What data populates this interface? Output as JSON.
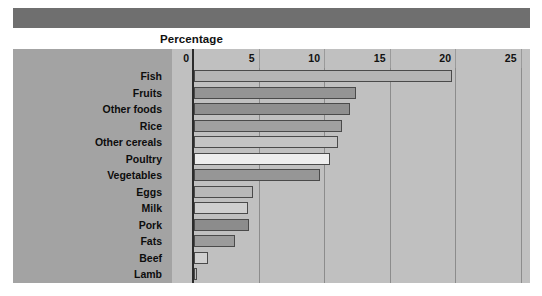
{
  "figure": {
    "axis_title": "Percentage",
    "top_band_color": "#6f6f6f",
    "frame_color": "#c0c0c0",
    "category_panel_color": "#a3a3a3"
  },
  "chart_data": {
    "type": "bar",
    "orientation": "horizontal",
    "title": "",
    "xlabel": "Percentage",
    "ylabel": "",
    "xlim": [
      0,
      27
    ],
    "xticks": [
      0,
      5,
      10,
      15,
      20,
      25
    ],
    "xtick_labels": [
      "0",
      "5",
      "10",
      "15",
      "20",
      "25"
    ],
    "grid": true,
    "legend": "none",
    "categories": [
      "Fish",
      "Fruits",
      "Other foods",
      "Rice",
      "Other cereals",
      "Poultry",
      "Vegetables",
      "Eggs",
      "Milk",
      "Pork",
      "Fats",
      "Beef",
      "Lamb"
    ],
    "values": [
      19.7,
      12.4,
      11.9,
      11.3,
      11.0,
      10.4,
      9.6,
      4.5,
      4.1,
      4.2,
      3.1,
      1.1,
      0.2
    ],
    "bar_colors": [
      "#b5b5b5",
      "#949494",
      "#8f8f8f",
      "#a0a0a0",
      "#c4c4c4",
      "#ededed",
      "#969696",
      "#b8b8b8",
      "#cfcfcf",
      "#8c8c8c",
      "#9b9b9b",
      "#d0d0d0",
      "#bdbdbd"
    ]
  }
}
